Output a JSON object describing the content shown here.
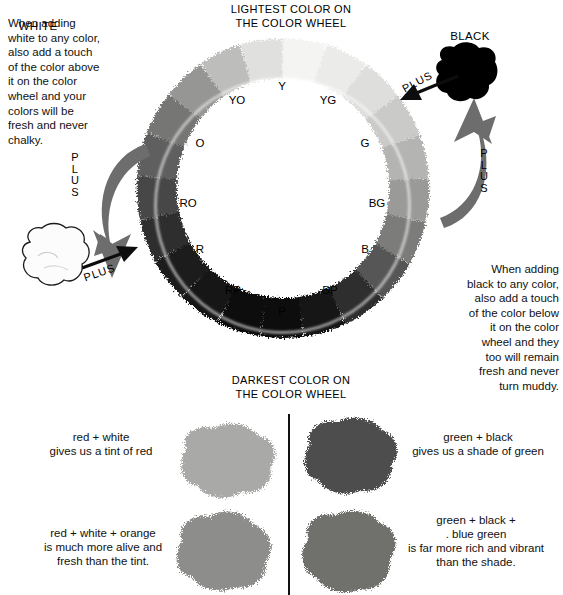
{
  "page": {
    "background": "#ffffff"
  },
  "wheel": {
    "caption_top": "LIGHTEST COLOR ON\nTHE COLOR WHEEL",
    "caption_bottom": "DARKEST COLOR ON\nTHE COLOR WHEEL",
    "hue_labels": [
      {
        "key": "Y",
        "label": "Y",
        "angle_deg": 90,
        "value": 0.97,
        "x": 167,
        "y": 48
      },
      {
        "key": "YG",
        "label": "YG",
        "angle_deg": 60,
        "value": 0.92,
        "x": 213,
        "y": 62
      },
      {
        "key": "G",
        "label": "G",
        "angle_deg": 30,
        "value": 0.8,
        "x": 250,
        "y": 105
      },
      {
        "key": "BG",
        "label": "BG",
        "angle_deg": 0,
        "value": 0.62,
        "x": 262,
        "y": 165
      },
      {
        "key": "B",
        "label": "B",
        "angle_deg": -30,
        "value": 0.4,
        "x": 250,
        "y": 211
      },
      {
        "key": "BP",
        "label": "BP",
        "angle_deg": -60,
        "value": 0.18,
        "x": 215,
        "y": 252
      },
      {
        "key": "P",
        "label": "P",
        "angle_deg": -90,
        "value": 0.06,
        "x": 167,
        "y": 273
      },
      {
        "key": "RP",
        "label": "RP",
        "angle_deg": 240,
        "value": 0.15,
        "x": 118,
        "y": 252
      },
      {
        "key": "R",
        "label": "R",
        "angle_deg": 210,
        "value": 0.3,
        "x": 85,
        "y": 211
      },
      {
        "key": "RO",
        "label": "RO",
        "angle_deg": 180,
        "value": 0.46,
        "x": 73,
        "y": 165
      },
      {
        "key": "O",
        "label": "O",
        "angle_deg": 150,
        "value": 0.62,
        "x": 85,
        "y": 105
      },
      {
        "key": "YO",
        "label": "YO",
        "angle_deg": 120,
        "value": 0.82,
        "x": 122,
        "y": 62
      }
    ],
    "ring_stops": [
      {
        "offset": 0.0,
        "color": "#f2f2f0"
      },
      {
        "offset": 0.06,
        "color": "#e2e2e0"
      },
      {
        "offset": 0.14,
        "color": "#cacac8"
      },
      {
        "offset": 0.22,
        "color": "#b2b2b0"
      },
      {
        "offset": 0.3,
        "color": "#909090"
      },
      {
        "offset": 0.38,
        "color": "#6e6e6e"
      },
      {
        "offset": 0.46,
        "color": "#3c3c3c"
      },
      {
        "offset": 0.54,
        "color": "#1a1a1a"
      },
      {
        "offset": 0.64,
        "color": "#0a0a0a"
      },
      {
        "offset": 0.74,
        "color": "#141414"
      },
      {
        "offset": 0.82,
        "color": "#3a3a3a"
      },
      {
        "offset": 0.88,
        "color": "#6a6a6a"
      },
      {
        "offset": 0.94,
        "color": "#a8a8a6"
      },
      {
        "offset": 1.0,
        "color": "#f2f2f0"
      }
    ]
  },
  "notes": {
    "white_note": "When adding\nwhite to any color,\nalso add a touch\nof the color above\nit on the color\nwheel and your\ncolors will be\nfresh and never\nchalky.",
    "black_note": "When adding\nblack to any color,\nalso add a touch\nof the color below\nit on the color\nwheel and they\ntoo will remain\nfresh and never\nturn muddy."
  },
  "pigments": {
    "white_label": "WHITE",
    "white_color": "#fbfbfb",
    "black_label": "BLACK",
    "black_color": "#000000"
  },
  "plus_labels": {
    "left_vertical": "P\nL\nU\nS",
    "right_vertical": "P\nL\nU\nS",
    "white_diagonal": "PLUS",
    "black_diagonal": "PLUS"
  },
  "comparison": {
    "rows": [
      {
        "id": "tint-red",
        "caption": "red + white\ngives us a tint of red",
        "swatch_color": "#a9a9a7",
        "side": "left"
      },
      {
        "id": "tint-red-plus",
        "caption": "red + white + orange\nis much more alive and\nfresh than the tint.",
        "swatch_color": "#8d8d8b",
        "side": "left"
      },
      {
        "id": "shade-green",
        "caption": "green + black\ngives us a shade of green",
        "swatch_color": "#4e4e4e",
        "side": "right"
      },
      {
        "id": "shade-green-plus",
        "caption": "green + black +\n.   blue green\nis far more rich and vibrant\nthan the shade.",
        "swatch_color": "#6f6f6d",
        "side": "right"
      }
    ],
    "divider_color": "#111111"
  }
}
